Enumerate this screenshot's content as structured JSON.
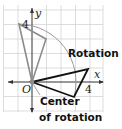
{
  "diagram": {
    "title": "Rotation",
    "labels": {
      "y_axis": "y",
      "x_axis": "x",
      "origin": "O",
      "y_tick": "4",
      "x_tick": "4",
      "rotation": "Rotation",
      "center_line1": "Center",
      "center_line2": "of rotation"
    },
    "colors": {
      "grid": "#d4d4d4",
      "axis": "#333333",
      "preimage": "#8c8c8c",
      "image": "#111111",
      "arc": "#9a9a9a",
      "center_point": "#8c8c8c"
    }
  }
}
